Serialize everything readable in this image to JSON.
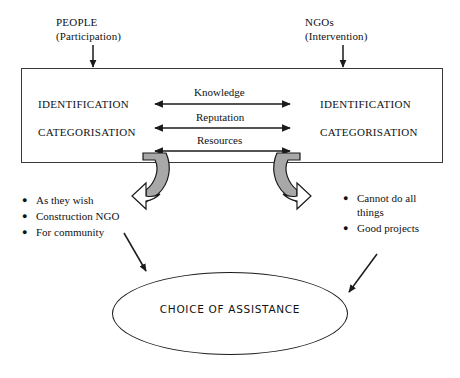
{
  "diagram": {
    "title_text": "",
    "sources": [
      {
        "name": "PEOPLE",
        "qualifier": "(Participation)",
        "arrow": "down-arrow"
      },
      {
        "name": "NGOs",
        "qualifier": "(Intervention)",
        "arrow": "down-arrow"
      }
    ],
    "process_box": {
      "left_column": [
        "IDENTIFICATION",
        "CATEGORISATION"
      ],
      "right_column": [
        "IDENTIFICATION",
        "CATEGORISATION"
      ],
      "exchange_flows": [
        "Knowledge",
        "Reputation",
        "Resources"
      ]
    },
    "outcomes": {
      "left": {
        "items": [
          "As they wish",
          "Construction NGO",
          "For community"
        ],
        "bullet_glyph": "●"
      },
      "right": {
        "items": [
          "Cannot do all things",
          "Good projects"
        ],
        "bullet_glyph": "●"
      }
    },
    "result": {
      "label": "CHOICE OF ASSISTANCE",
      "shape": "ellipse"
    },
    "colors": {
      "stroke": "#1a1a1a",
      "box_stroke": "#3a3a3a",
      "curl_fill": "#a8a8a8",
      "background": "#ffffff"
    }
  }
}
